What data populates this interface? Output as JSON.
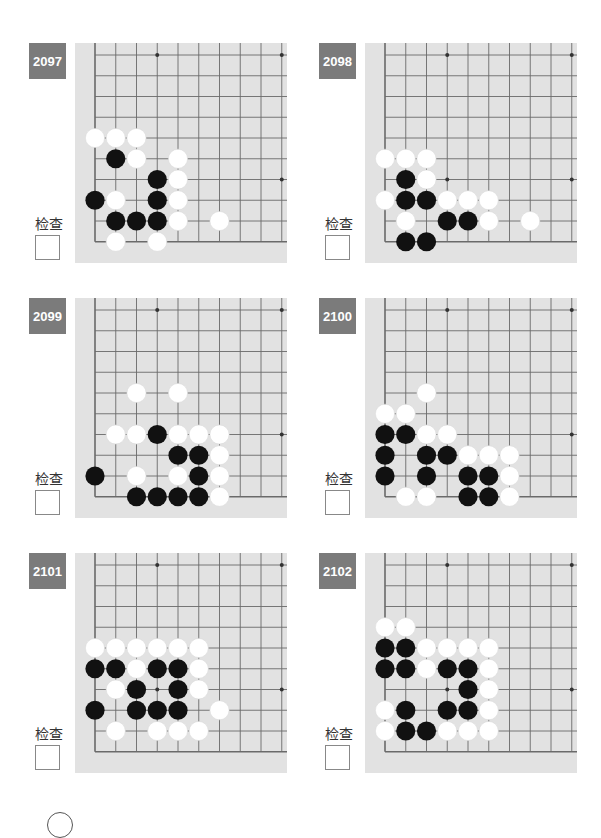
{
  "page": {
    "check_label": "检查",
    "colors": {
      "label_bg": "#7b7b7b",
      "board_bg": "#e2e2e2",
      "grid_line": "#6a6a6a",
      "black_stone": "#111111",
      "white_stone": "#ffffff"
    }
  },
  "problems": [
    {
      "number": "2097",
      "black": [
        [
          1,
          5
        ],
        [
          3,
          6
        ],
        [
          0,
          7
        ],
        [
          3,
          7
        ],
        [
          1,
          8
        ],
        [
          2,
          8
        ],
        [
          3,
          8
        ]
      ],
      "white": [
        [
          0,
          4
        ],
        [
          1,
          4
        ],
        [
          2,
          4
        ],
        [
          2,
          5
        ],
        [
          4,
          5
        ],
        [
          4,
          6
        ],
        [
          1,
          7
        ],
        [
          4,
          7
        ],
        [
          4,
          8
        ],
        [
          6,
          8
        ],
        [
          1,
          9
        ],
        [
          3,
          9
        ]
      ]
    },
    {
      "number": "2098",
      "black": [
        [
          1,
          6
        ],
        [
          1,
          7
        ],
        [
          2,
          7
        ],
        [
          3,
          8
        ],
        [
          4,
          8
        ],
        [
          1,
          9
        ],
        [
          2,
          9
        ]
      ],
      "white": [
        [
          0,
          5
        ],
        [
          1,
          5
        ],
        [
          2,
          5
        ],
        [
          2,
          6
        ],
        [
          0,
          7
        ],
        [
          3,
          7
        ],
        [
          4,
          7
        ],
        [
          5,
          7
        ],
        [
          1,
          8
        ],
        [
          5,
          8
        ],
        [
          7,
          8
        ]
      ]
    },
    {
      "number": "2099",
      "black": [
        [
          3,
          6
        ],
        [
          4,
          7
        ],
        [
          5,
          7
        ],
        [
          0,
          8
        ],
        [
          5,
          8
        ],
        [
          2,
          9
        ],
        [
          3,
          9
        ],
        [
          4,
          9
        ],
        [
          5,
          9
        ]
      ],
      "white": [
        [
          2,
          4
        ],
        [
          4,
          4
        ],
        [
          1,
          6
        ],
        [
          2,
          6
        ],
        [
          4,
          6
        ],
        [
          5,
          6
        ],
        [
          6,
          6
        ],
        [
          6,
          7
        ],
        [
          2,
          8
        ],
        [
          4,
          8
        ],
        [
          6,
          8
        ],
        [
          6,
          9
        ]
      ]
    },
    {
      "number": "2100",
      "black": [
        [
          0,
          6
        ],
        [
          1,
          6
        ],
        [
          0,
          7
        ],
        [
          2,
          7
        ],
        [
          3,
          7
        ],
        [
          0,
          8
        ],
        [
          2,
          8
        ],
        [
          4,
          8
        ],
        [
          5,
          8
        ],
        [
          4,
          9
        ],
        [
          5,
          9
        ]
      ],
      "white": [
        [
          2,
          4
        ],
        [
          0,
          5
        ],
        [
          1,
          5
        ],
        [
          2,
          6
        ],
        [
          3,
          6
        ],
        [
          4,
          7
        ],
        [
          5,
          7
        ],
        [
          6,
          7
        ],
        [
          6,
          8
        ],
        [
          1,
          9
        ],
        [
          2,
          9
        ],
        [
          6,
          9
        ]
      ]
    },
    {
      "number": "2101",
      "black": [
        [
          0,
          5
        ],
        [
          1,
          5
        ],
        [
          3,
          5
        ],
        [
          4,
          5
        ],
        [
          2,
          6
        ],
        [
          4,
          6
        ],
        [
          0,
          7
        ],
        [
          2,
          7
        ],
        [
          3,
          7
        ],
        [
          4,
          7
        ]
      ],
      "white": [
        [
          0,
          4
        ],
        [
          1,
          4
        ],
        [
          2,
          4
        ],
        [
          3,
          4
        ],
        [
          4,
          4
        ],
        [
          5,
          4
        ],
        [
          2,
          5
        ],
        [
          5,
          5
        ],
        [
          1,
          6
        ],
        [
          5,
          6
        ],
        [
          6,
          7
        ],
        [
          1,
          8
        ],
        [
          3,
          8
        ],
        [
          4,
          8
        ],
        [
          5,
          8
        ]
      ]
    },
    {
      "number": "2102",
      "black": [
        [
          0,
          4
        ],
        [
          1,
          4
        ],
        [
          0,
          5
        ],
        [
          1,
          5
        ],
        [
          3,
          5
        ],
        [
          4,
          5
        ],
        [
          4,
          6
        ],
        [
          1,
          7
        ],
        [
          3,
          7
        ],
        [
          4,
          7
        ],
        [
          1,
          8
        ],
        [
          2,
          8
        ]
      ],
      "white": [
        [
          0,
          3
        ],
        [
          1,
          3
        ],
        [
          2,
          4
        ],
        [
          3,
          4
        ],
        [
          4,
          4
        ],
        [
          5,
          4
        ],
        [
          2,
          5
        ],
        [
          5,
          5
        ],
        [
          5,
          6
        ],
        [
          0,
          7
        ],
        [
          5,
          7
        ],
        [
          0,
          8
        ],
        [
          3,
          8
        ],
        [
          4,
          8
        ],
        [
          5,
          8
        ]
      ]
    }
  ],
  "board_geometry": {
    "columns": 10,
    "rows": 10,
    "star_points": [
      [
        3,
        0
      ],
      [
        9,
        0
      ],
      [
        3,
        6
      ],
      [
        9,
        6
      ]
    ]
  }
}
